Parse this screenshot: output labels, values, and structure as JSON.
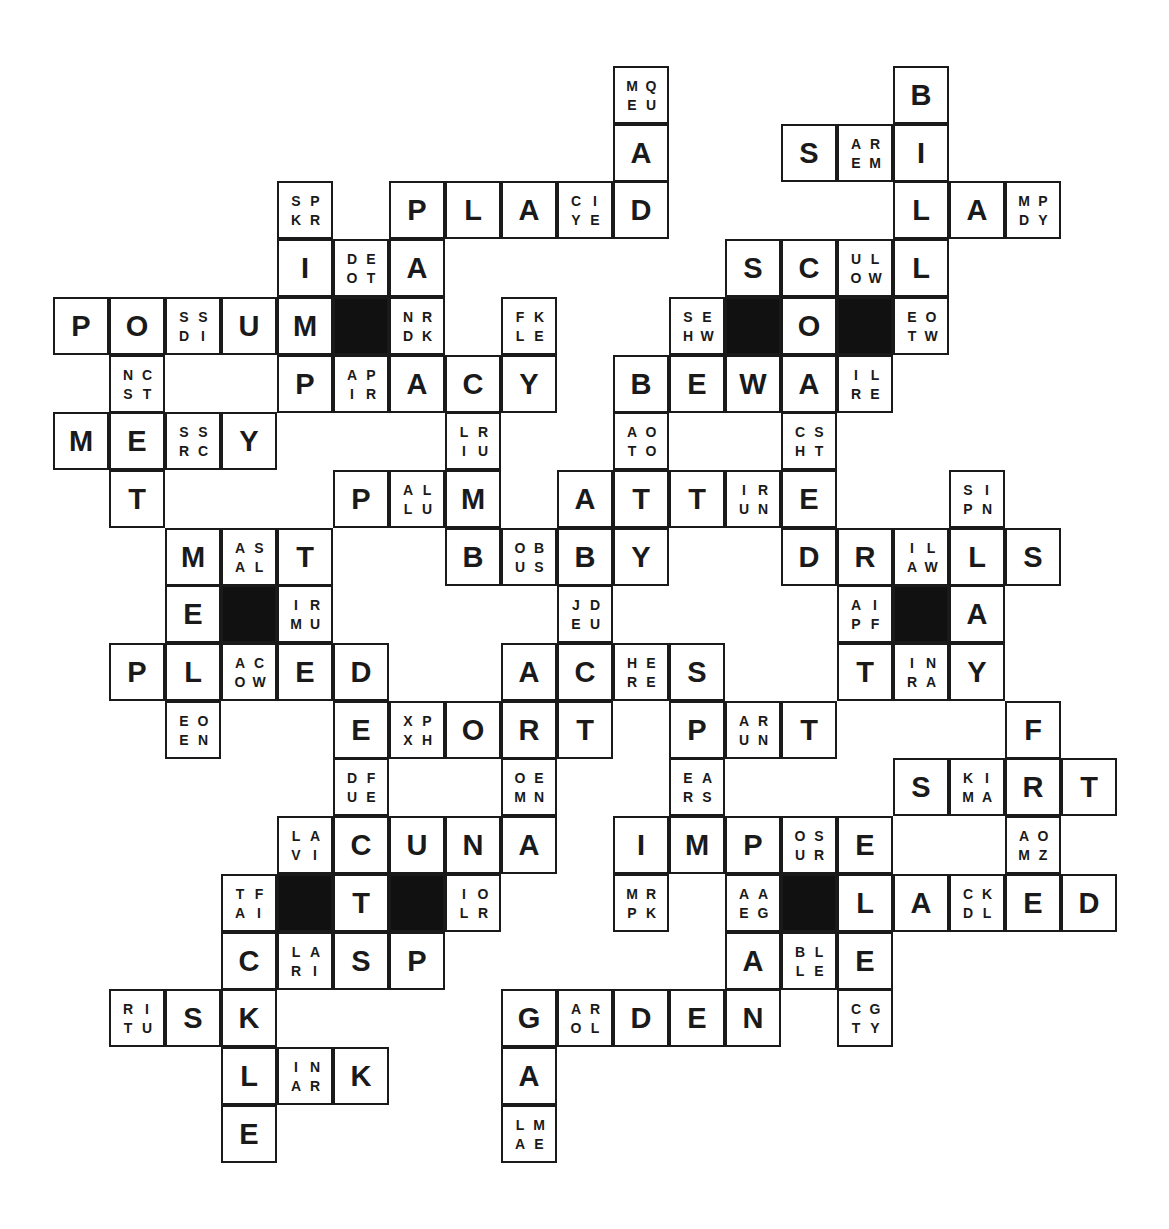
{
  "puzzle": {
    "type": "letter-choice crossword",
    "grid": {
      "origin_x": 54,
      "origin_y": 67,
      "cell_w": 56,
      "cell_h": 57.7,
      "rows": 19,
      "cols": 19
    },
    "colors": {
      "ink": "#1a1a1a",
      "black_cell": "#111111",
      "background": "#ffffff"
    },
    "cells": [
      {
        "r": 0,
        "c": 10,
        "t": "clue",
        "v": [
          "M",
          "Q",
          "E",
          "U"
        ]
      },
      {
        "r": 0,
        "c": 15,
        "t": "letter",
        "v": "B"
      },
      {
        "r": 1,
        "c": 10,
        "t": "letter",
        "v": "A"
      },
      {
        "r": 1,
        "c": 13,
        "t": "letter",
        "v": "S"
      },
      {
        "r": 1,
        "c": 14,
        "t": "clue",
        "v": [
          "A",
          "R",
          "E",
          "M"
        ]
      },
      {
        "r": 1,
        "c": 15,
        "t": "letter",
        "v": "I"
      },
      {
        "r": 2,
        "c": 4,
        "t": "clue",
        "v": [
          "S",
          "P",
          "K",
          "R"
        ]
      },
      {
        "r": 2,
        "c": 6,
        "t": "letter",
        "v": "P"
      },
      {
        "r": 2,
        "c": 7,
        "t": "letter",
        "v": "L"
      },
      {
        "r": 2,
        "c": 8,
        "t": "letter",
        "v": "A"
      },
      {
        "r": 2,
        "c": 9,
        "t": "clue",
        "v": [
          "C",
          "I",
          "Y",
          "E"
        ]
      },
      {
        "r": 2,
        "c": 10,
        "t": "letter",
        "v": "D"
      },
      {
        "r": 2,
        "c": 15,
        "t": "letter",
        "v": "L"
      },
      {
        "r": 2,
        "c": 16,
        "t": "letter",
        "v": "A"
      },
      {
        "r": 2,
        "c": 17,
        "t": "clue",
        "v": [
          "M",
          "P",
          "D",
          "Y"
        ]
      },
      {
        "r": 3,
        "c": 4,
        "t": "letter",
        "v": "I"
      },
      {
        "r": 3,
        "c": 5,
        "t": "clue",
        "v": [
          "D",
          "E",
          "O",
          "T"
        ]
      },
      {
        "r": 3,
        "c": 6,
        "t": "letter",
        "v": "A"
      },
      {
        "r": 3,
        "c": 12,
        "t": "letter",
        "v": "S"
      },
      {
        "r": 3,
        "c": 13,
        "t": "letter",
        "v": "C"
      },
      {
        "r": 3,
        "c": 14,
        "t": "clue",
        "v": [
          "U",
          "L",
          "O",
          "W"
        ]
      },
      {
        "r": 3,
        "c": 15,
        "t": "letter",
        "v": "L"
      },
      {
        "r": 4,
        "c": 0,
        "t": "letter",
        "v": "P"
      },
      {
        "r": 4,
        "c": 1,
        "t": "letter",
        "v": "O"
      },
      {
        "r": 4,
        "c": 2,
        "t": "clue",
        "v": [
          "S",
          "S",
          "D",
          "I"
        ]
      },
      {
        "r": 4,
        "c": 3,
        "t": "letter",
        "v": "U"
      },
      {
        "r": 4,
        "c": 4,
        "t": "letter",
        "v": "M"
      },
      {
        "r": 4,
        "c": 5,
        "t": "black",
        "v": ""
      },
      {
        "r": 4,
        "c": 6,
        "t": "clue",
        "v": [
          "N",
          "R",
          "D",
          "K"
        ]
      },
      {
        "r": 4,
        "c": 8,
        "t": "clue",
        "v": [
          "F",
          "K",
          "L",
          "E"
        ]
      },
      {
        "r": 4,
        "c": 11,
        "t": "clue",
        "v": [
          "S",
          "E",
          "H",
          "W"
        ]
      },
      {
        "r": 4,
        "c": 12,
        "t": "black",
        "v": ""
      },
      {
        "r": 4,
        "c": 13,
        "t": "letter",
        "v": "O"
      },
      {
        "r": 4,
        "c": 14,
        "t": "black",
        "v": ""
      },
      {
        "r": 4,
        "c": 15,
        "t": "clue",
        "v": [
          "E",
          "O",
          "T",
          "W"
        ]
      },
      {
        "r": 5,
        "c": 1,
        "t": "clue",
        "v": [
          "N",
          "C",
          "S",
          "T"
        ]
      },
      {
        "r": 5,
        "c": 4,
        "t": "letter",
        "v": "P"
      },
      {
        "r": 5,
        "c": 5,
        "t": "clue",
        "v": [
          "A",
          "P",
          "I",
          "R"
        ]
      },
      {
        "r": 5,
        "c": 6,
        "t": "letter",
        "v": "A"
      },
      {
        "r": 5,
        "c": 7,
        "t": "letter",
        "v": "C"
      },
      {
        "r": 5,
        "c": 8,
        "t": "letter",
        "v": "Y"
      },
      {
        "r": 5,
        "c": 10,
        "t": "letter",
        "v": "B"
      },
      {
        "r": 5,
        "c": 11,
        "t": "letter",
        "v": "E"
      },
      {
        "r": 5,
        "c": 12,
        "t": "letter",
        "v": "W"
      },
      {
        "r": 5,
        "c": 13,
        "t": "letter",
        "v": "A"
      },
      {
        "r": 5,
        "c": 14,
        "t": "clue",
        "v": [
          "I",
          "L",
          "R",
          "E"
        ]
      },
      {
        "r": 6,
        "c": 0,
        "t": "letter",
        "v": "M"
      },
      {
        "r": 6,
        "c": 1,
        "t": "letter",
        "v": "E"
      },
      {
        "r": 6,
        "c": 2,
        "t": "clue",
        "v": [
          "S",
          "S",
          "R",
          "C"
        ]
      },
      {
        "r": 6,
        "c": 3,
        "t": "letter",
        "v": "Y"
      },
      {
        "r": 6,
        "c": 7,
        "t": "clue",
        "v": [
          "L",
          "R",
          "I",
          "U"
        ]
      },
      {
        "r": 6,
        "c": 10,
        "t": "clue",
        "v": [
          "A",
          "O",
          "T",
          "O"
        ]
      },
      {
        "r": 6,
        "c": 13,
        "t": "clue",
        "v": [
          "C",
          "S",
          "H",
          "T"
        ]
      },
      {
        "r": 7,
        "c": 1,
        "t": "letter",
        "v": "T"
      },
      {
        "r": 7,
        "c": 5,
        "t": "letter",
        "v": "P"
      },
      {
        "r": 7,
        "c": 6,
        "t": "clue",
        "v": [
          "A",
          "L",
          "L",
          "U"
        ]
      },
      {
        "r": 7,
        "c": 7,
        "t": "letter",
        "v": "M"
      },
      {
        "r": 7,
        "c": 9,
        "t": "letter",
        "v": "A"
      },
      {
        "r": 7,
        "c": 10,
        "t": "letter",
        "v": "T"
      },
      {
        "r": 7,
        "c": 11,
        "t": "letter",
        "v": "T"
      },
      {
        "r": 7,
        "c": 12,
        "t": "clue",
        "v": [
          "I",
          "R",
          "U",
          "N"
        ]
      },
      {
        "r": 7,
        "c": 13,
        "t": "letter",
        "v": "E"
      },
      {
        "r": 7,
        "c": 16,
        "t": "clue",
        "v": [
          "S",
          "I",
          "P",
          "N"
        ]
      },
      {
        "r": 8,
        "c": 2,
        "t": "letter",
        "v": "M"
      },
      {
        "r": 8,
        "c": 3,
        "t": "clue",
        "v": [
          "A",
          "S",
          "A",
          "L"
        ]
      },
      {
        "r": 8,
        "c": 4,
        "t": "letter",
        "v": "T"
      },
      {
        "r": 8,
        "c": 7,
        "t": "letter",
        "v": "B"
      },
      {
        "r": 8,
        "c": 8,
        "t": "clue",
        "v": [
          "O",
          "B",
          "U",
          "S"
        ]
      },
      {
        "r": 8,
        "c": 9,
        "t": "letter",
        "v": "B"
      },
      {
        "r": 8,
        "c": 10,
        "t": "letter",
        "v": "Y"
      },
      {
        "r": 8,
        "c": 13,
        "t": "letter",
        "v": "D"
      },
      {
        "r": 8,
        "c": 14,
        "t": "letter",
        "v": "R"
      },
      {
        "r": 8,
        "c": 15,
        "t": "clue",
        "v": [
          "I",
          "L",
          "A",
          "W"
        ]
      },
      {
        "r": 8,
        "c": 16,
        "t": "letter",
        "v": "L"
      },
      {
        "r": 8,
        "c": 17,
        "t": "letter",
        "v": "S"
      },
      {
        "r": 9,
        "c": 2,
        "t": "letter",
        "v": "E"
      },
      {
        "r": 9,
        "c": 3,
        "t": "black",
        "v": ""
      },
      {
        "r": 9,
        "c": 4,
        "t": "clue",
        "v": [
          "I",
          "R",
          "M",
          "U"
        ]
      },
      {
        "r": 9,
        "c": 9,
        "t": "clue",
        "v": [
          "J",
          "D",
          "E",
          "U"
        ]
      },
      {
        "r": 9,
        "c": 14,
        "t": "clue",
        "v": [
          "A",
          "I",
          "P",
          "F"
        ]
      },
      {
        "r": 9,
        "c": 15,
        "t": "black",
        "v": ""
      },
      {
        "r": 9,
        "c": 16,
        "t": "letter",
        "v": "A"
      },
      {
        "r": 10,
        "c": 1,
        "t": "letter",
        "v": "P"
      },
      {
        "r": 10,
        "c": 2,
        "t": "letter",
        "v": "L"
      },
      {
        "r": 10,
        "c": 3,
        "t": "clue",
        "v": [
          "A",
          "C",
          "O",
          "W"
        ]
      },
      {
        "r": 10,
        "c": 4,
        "t": "letter",
        "v": "E"
      },
      {
        "r": 10,
        "c": 5,
        "t": "letter",
        "v": "D"
      },
      {
        "r": 10,
        "c": 8,
        "t": "letter",
        "v": "A"
      },
      {
        "r": 10,
        "c": 9,
        "t": "letter",
        "v": "C"
      },
      {
        "r": 10,
        "c": 10,
        "t": "clue",
        "v": [
          "H",
          "E",
          "R",
          "E"
        ]
      },
      {
        "r": 10,
        "c": 11,
        "t": "letter",
        "v": "S"
      },
      {
        "r": 10,
        "c": 14,
        "t": "letter",
        "v": "T"
      },
      {
        "r": 10,
        "c": 15,
        "t": "clue",
        "v": [
          "I",
          "N",
          "R",
          "A"
        ]
      },
      {
        "r": 10,
        "c": 16,
        "t": "letter",
        "v": "Y"
      },
      {
        "r": 11,
        "c": 2,
        "t": "clue",
        "v": [
          "E",
          "O",
          "E",
          "N"
        ]
      },
      {
        "r": 11,
        "c": 5,
        "t": "letter",
        "v": "E"
      },
      {
        "r": 11,
        "c": 6,
        "t": "clue",
        "v": [
          "X",
          "P",
          "X",
          "H"
        ]
      },
      {
        "r": 11,
        "c": 7,
        "t": "letter",
        "v": "O"
      },
      {
        "r": 11,
        "c": 8,
        "t": "letter",
        "v": "R"
      },
      {
        "r": 11,
        "c": 9,
        "t": "letter",
        "v": "T"
      },
      {
        "r": 11,
        "c": 11,
        "t": "letter",
        "v": "P"
      },
      {
        "r": 11,
        "c": 12,
        "t": "clue",
        "v": [
          "A",
          "R",
          "U",
          "N"
        ]
      },
      {
        "r": 11,
        "c": 13,
        "t": "letter",
        "v": "T"
      },
      {
        "r": 11,
        "c": 17,
        "t": "letter",
        "v": "F"
      },
      {
        "r": 12,
        "c": 5,
        "t": "clue",
        "v": [
          "D",
          "F",
          "U",
          "E"
        ]
      },
      {
        "r": 12,
        "c": 8,
        "t": "clue",
        "v": [
          "O",
          "E",
          "M",
          "N"
        ]
      },
      {
        "r": 12,
        "c": 11,
        "t": "clue",
        "v": [
          "E",
          "A",
          "R",
          "S"
        ]
      },
      {
        "r": 12,
        "c": 15,
        "t": "letter",
        "v": "S"
      },
      {
        "r": 12,
        "c": 16,
        "t": "clue",
        "v": [
          "K",
          "I",
          "M",
          "A"
        ]
      },
      {
        "r": 12,
        "c": 17,
        "t": "letter",
        "v": "R"
      },
      {
        "r": 12,
        "c": 18,
        "t": "letter",
        "v": "T"
      },
      {
        "r": 13,
        "c": 4,
        "t": "clue",
        "v": [
          "L",
          "A",
          "V",
          "I"
        ]
      },
      {
        "r": 13,
        "c": 5,
        "t": "letter",
        "v": "C"
      },
      {
        "r": 13,
        "c": 6,
        "t": "letter",
        "v": "U"
      },
      {
        "r": 13,
        "c": 7,
        "t": "letter",
        "v": "N"
      },
      {
        "r": 13,
        "c": 8,
        "t": "letter",
        "v": "A"
      },
      {
        "r": 13,
        "c": 10,
        "t": "letter",
        "v": "I"
      },
      {
        "r": 13,
        "c": 11,
        "t": "letter",
        "v": "M"
      },
      {
        "r": 13,
        "c": 12,
        "t": "letter",
        "v": "P"
      },
      {
        "r": 13,
        "c": 13,
        "t": "clue",
        "v": [
          "O",
          "S",
          "U",
          "R"
        ]
      },
      {
        "r": 13,
        "c": 14,
        "t": "letter",
        "v": "E"
      },
      {
        "r": 13,
        "c": 17,
        "t": "clue",
        "v": [
          "A",
          "O",
          "M",
          "Z"
        ]
      },
      {
        "r": 14,
        "c": 3,
        "t": "clue",
        "v": [
          "T",
          "F",
          "A",
          "I"
        ]
      },
      {
        "r": 14,
        "c": 4,
        "t": "black",
        "v": ""
      },
      {
        "r": 14,
        "c": 5,
        "t": "letter",
        "v": "T"
      },
      {
        "r": 14,
        "c": 6,
        "t": "black",
        "v": ""
      },
      {
        "r": 14,
        "c": 7,
        "t": "clue",
        "v": [
          "I",
          "O",
          "L",
          "R"
        ]
      },
      {
        "r": 14,
        "c": 10,
        "t": "clue",
        "v": [
          "M",
          "R",
          "P",
          "K"
        ]
      },
      {
        "r": 14,
        "c": 12,
        "t": "clue",
        "v": [
          "A",
          "A",
          "E",
          "G"
        ]
      },
      {
        "r": 14,
        "c": 13,
        "t": "black",
        "v": ""
      },
      {
        "r": 14,
        "c": 14,
        "t": "letter",
        "v": "L"
      },
      {
        "r": 14,
        "c": 15,
        "t": "letter",
        "v": "A"
      },
      {
        "r": 14,
        "c": 16,
        "t": "clue",
        "v": [
          "C",
          "K",
          "D",
          "L"
        ]
      },
      {
        "r": 14,
        "c": 17,
        "t": "letter",
        "v": "E"
      },
      {
        "r": 14,
        "c": 18,
        "t": "letter",
        "v": "D"
      },
      {
        "r": 15,
        "c": 3,
        "t": "letter",
        "v": "C"
      },
      {
        "r": 15,
        "c": 4,
        "t": "clue",
        "v": [
          "L",
          "A",
          "R",
          "I"
        ]
      },
      {
        "r": 15,
        "c": 5,
        "t": "letter",
        "v": "S"
      },
      {
        "r": 15,
        "c": 6,
        "t": "letter",
        "v": "P"
      },
      {
        "r": 15,
        "c": 12,
        "t": "letter",
        "v": "A"
      },
      {
        "r": 15,
        "c": 13,
        "t": "clue",
        "v": [
          "B",
          "L",
          "L",
          "E"
        ]
      },
      {
        "r": 15,
        "c": 14,
        "t": "letter",
        "v": "E"
      },
      {
        "r": 16,
        "c": 1,
        "t": "clue",
        "v": [
          "R",
          "I",
          "T",
          "U"
        ]
      },
      {
        "r": 16,
        "c": 2,
        "t": "letter",
        "v": "S"
      },
      {
        "r": 16,
        "c": 3,
        "t": "letter",
        "v": "K"
      },
      {
        "r": 16,
        "c": 8,
        "t": "letter",
        "v": "G"
      },
      {
        "r": 16,
        "c": 9,
        "t": "clue",
        "v": [
          "A",
          "R",
          "O",
          "L"
        ]
      },
      {
        "r": 16,
        "c": 10,
        "t": "letter",
        "v": "D"
      },
      {
        "r": 16,
        "c": 11,
        "t": "letter",
        "v": "E"
      },
      {
        "r": 16,
        "c": 12,
        "t": "letter",
        "v": "N"
      },
      {
        "r": 16,
        "c": 14,
        "t": "clue",
        "v": [
          "C",
          "G",
          "T",
          "Y"
        ]
      },
      {
        "r": 17,
        "c": 3,
        "t": "letter",
        "v": "L"
      },
      {
        "r": 17,
        "c": 4,
        "t": "clue",
        "v": [
          "I",
          "N",
          "A",
          "R"
        ]
      },
      {
        "r": 17,
        "c": 5,
        "t": "letter",
        "v": "K"
      },
      {
        "r": 17,
        "c": 8,
        "t": "letter",
        "v": "A"
      },
      {
        "r": 18,
        "c": 3,
        "t": "letter",
        "v": "E"
      },
      {
        "r": 18,
        "c": 8,
        "t": "clue",
        "v": [
          "L",
          "M",
          "A",
          "E"
        ]
      }
    ]
  }
}
